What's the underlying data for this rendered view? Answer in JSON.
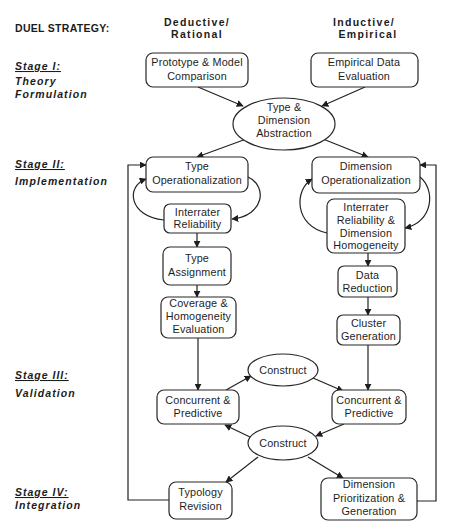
{
  "header": {
    "title": "DUEL STRATEGY:",
    "columns": [
      {
        "id": "deductive",
        "line1": "Deductive/",
        "line2": "Rational"
      },
      {
        "id": "inductive",
        "line1": "Inductive/",
        "line2": "Empirical"
      }
    ]
  },
  "stages": [
    {
      "label": "Stage  I:",
      "name_lines": [
        "Theory",
        "Formulation"
      ]
    },
    {
      "label": "Stage  II:",
      "name_lines": [
        "Implementation"
      ]
    },
    {
      "label": "Stage  III:",
      "name_lines": [
        "Validation"
      ]
    },
    {
      "label": "Stage  IV:",
      "name_lines": [
        "Integration"
      ]
    }
  ],
  "nodes": {
    "prototype_comparison": {
      "shape": "rounded-box",
      "lines": [
        "Prototype & Model",
        "Comparison"
      ]
    },
    "empirical_evaluation": {
      "shape": "rounded-box",
      "lines": [
        "Empirical  Data",
        "Evaluation"
      ]
    },
    "abstraction": {
      "shape": "ellipse",
      "lines": [
        "Type &",
        "Dimension",
        "Abstraction"
      ]
    },
    "type_operationalization": {
      "shape": "rounded-box",
      "lines": [
        "Type",
        "Operationalization"
      ]
    },
    "interrater_left": {
      "shape": "rounded-box",
      "lines": [
        "Interrater",
        "Reliability"
      ]
    },
    "type_assignment": {
      "shape": "rounded-box",
      "lines": [
        "Type",
        "Assignment"
      ]
    },
    "coverage_evaluation": {
      "shape": "rounded-box",
      "lines": [
        "Coverage &",
        "Homogeneity",
        "Evaluation"
      ]
    },
    "dimension_operationalization": {
      "shape": "rounded-box",
      "lines": [
        "Dimension",
        "Operationalization"
      ]
    },
    "interrater_right": {
      "shape": "rounded-box",
      "lines": [
        "Interrater",
        "Reliability   &",
        "Dimension",
        "Homogeneity"
      ]
    },
    "data_reduction": {
      "shape": "rounded-box",
      "lines": [
        "Data",
        "Reduction"
      ]
    },
    "cluster_generation": {
      "shape": "rounded-box",
      "lines": [
        "Cluster",
        "Generation"
      ]
    },
    "concurrent_left": {
      "shape": "rounded-box",
      "lines": [
        "Concurrent  &",
        "Predictive"
      ]
    },
    "construct_top": {
      "shape": "ellipse",
      "lines": [
        "Construct"
      ]
    },
    "concurrent_right": {
      "shape": "rounded-box",
      "lines": [
        "Concurrent  &",
        "Predictive"
      ]
    },
    "construct_bottom": {
      "shape": "ellipse",
      "lines": [
        "Construct"
      ]
    },
    "typology_revision": {
      "shape": "rounded-box",
      "lines": [
        "Typology",
        "Revision"
      ]
    },
    "dimension_prioritization": {
      "shape": "rounded-box",
      "lines": [
        "Dimension",
        "Prioritization   &",
        "Generation"
      ]
    }
  },
  "edges": [
    {
      "from": "prototype_comparison",
      "to": "abstraction"
    },
    {
      "from": "empirical_evaluation",
      "to": "abstraction"
    },
    {
      "from": "abstraction",
      "to": "type_operationalization"
    },
    {
      "from": "abstraction",
      "to": "dimension_operationalization"
    },
    {
      "from": "type_operationalization",
      "to": "interrater_left"
    },
    {
      "from": "interrater_left",
      "to": "type_operationalization"
    },
    {
      "from": "interrater_left",
      "to": "type_assignment"
    },
    {
      "from": "type_assignment",
      "to": "coverage_evaluation"
    },
    {
      "from": "coverage_evaluation",
      "to": "concurrent_left"
    },
    {
      "from": "dimension_operationalization",
      "to": "interrater_right"
    },
    {
      "from": "interrater_right",
      "to": "dimension_operationalization"
    },
    {
      "from": "interrater_right",
      "to": "data_reduction"
    },
    {
      "from": "data_reduction",
      "to": "cluster_generation"
    },
    {
      "from": "cluster_generation",
      "to": "concurrent_right"
    },
    {
      "from": "concurrent_left",
      "to": "construct_top"
    },
    {
      "from": "construct_top",
      "to": "concurrent_right"
    },
    {
      "from": "concurrent_right",
      "to": "construct_bottom"
    },
    {
      "from": "construct_bottom",
      "to": "concurrent_left"
    },
    {
      "from": "construct_bottom",
      "to": "typology_revision"
    },
    {
      "from": "construct_bottom",
      "to": "dimension_prioritization"
    },
    {
      "from": "typology_revision",
      "to": "type_operationalization"
    },
    {
      "from": "dimension_prioritization",
      "to": "dimension_operationalization"
    }
  ]
}
